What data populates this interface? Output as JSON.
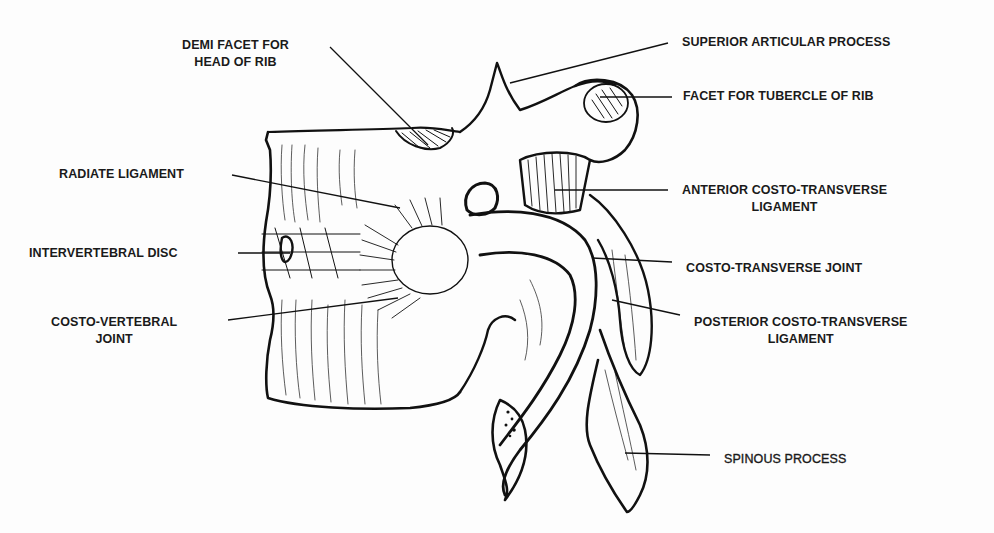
{
  "figure": {
    "ink_color": "#111111",
    "background_color": "#fdfdfd"
  },
  "labels": {
    "demi_facet": {
      "line1": "DEMI FACET FOR",
      "line2": "HEAD OF RIB"
    },
    "superior_articular": {
      "line1": "SUPERIOR ARTICULAR PROCESS"
    },
    "facet_tubercle": {
      "line1": "FACET FOR TUBERCLE OF RIB"
    },
    "radiate_ligament": {
      "line1": "RADIATE LIGAMENT"
    },
    "anterior_ct_ligament": {
      "line1": "ANTERIOR COSTO-TRANSVERSE",
      "line2": "LIGAMENT"
    },
    "intervertebral_disc": {
      "line1": "INTERVERTEBRAL DISC"
    },
    "costo_transverse_joint": {
      "line1": "COSTO-TRANSVERSE JOINT"
    },
    "costo_vertebral_joint": {
      "line1": "COSTO-VERTEBRAL",
      "line2": "JOINT"
    },
    "posterior_ct_ligament": {
      "line1": "POSTERIOR COSTO-TRANSVERSE",
      "line2": "LIGAMENT"
    },
    "spinous_process": {
      "line1": "SPINOUS PROCESS"
    }
  }
}
